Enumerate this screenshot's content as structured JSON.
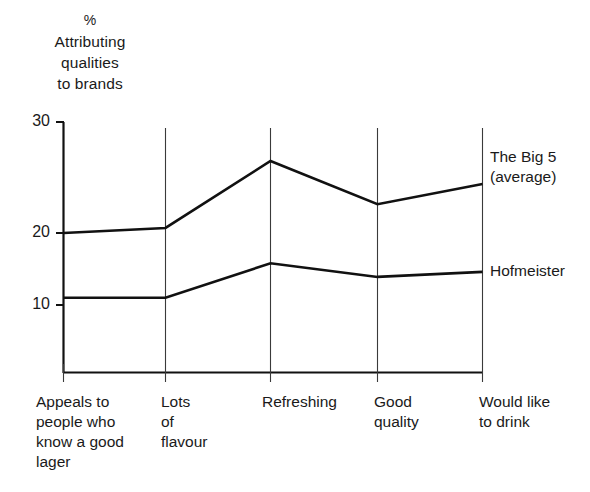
{
  "chart_data": {
    "type": "line",
    "title": "",
    "ylabel": "% Attributing qualities to brands",
    "ylabel_lines": [
      "%",
      "Attributing",
      "qualities",
      "to brands"
    ],
    "xlabel": "",
    "categories": [
      "Appeals to people who know a good lager",
      "Lots of flavour",
      "Refreshing",
      "Good quality",
      "Would like to drink"
    ],
    "category_lines": [
      [
        "Appeals to",
        "people who",
        "know a good",
        "lager"
      ],
      [
        "Lots",
        "of",
        "flavour"
      ],
      [
        "Refreshing"
      ],
      [
        "Good",
        "quality"
      ],
      [
        "Would like",
        "to drink"
      ]
    ],
    "series": [
      {
        "name": "The Big 5 (average)",
        "name_lines": [
          "The Big 5",
          "(average)"
        ],
        "values": [
          20.0,
          20.7,
          30.0,
          24.0,
          26.8
        ],
        "color": "#111111"
      },
      {
        "name": "Hofmeister",
        "name_lines": [
          "Hofmeister"
        ],
        "values": [
          11.0,
          11.0,
          15.8,
          13.9,
          14.6
        ],
        "color": "#111111"
      }
    ],
    "ylim": [
      0,
      31.5
    ],
    "yticks": [
      10,
      20,
      30
    ],
    "ytick_labels": [
      "10",
      "20",
      "30"
    ],
    "grid": "vertical-category-lines",
    "legend_position": "right-of-line-ends"
  }
}
